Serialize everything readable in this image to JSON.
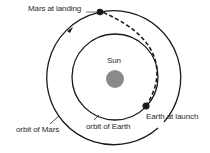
{
  "diagram": {
    "labels": {
      "mars_landing": "Mars  at landing",
      "sun": "Sun",
      "earth_launch": "Earth at launch",
      "orbit_mars": "orbit of Mars",
      "orbit_earth": "orbit of Earth"
    },
    "colors": {
      "line": "#1a1a1a",
      "sun": "#8a8a8a",
      "text": "#2a2a2a",
      "background": "#ffffff"
    },
    "geometry": {
      "center": [
        115,
        77
      ],
      "earth_orbit_radius": 43,
      "mars_orbit_radius": 67,
      "sun_radius": 9,
      "mars_position": [
        100,
        12
      ],
      "earth_position": [
        146,
        106
      ]
    }
  }
}
